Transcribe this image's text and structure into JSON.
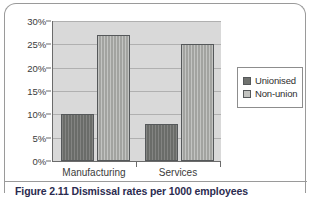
{
  "chart_data": {
    "type": "bar",
    "title": "",
    "xlabel": "",
    "ylabel": "",
    "categories": [
      "Manufacturing",
      "Services"
    ],
    "series": [
      {
        "name": "Unionised",
        "values": [
          10,
          8
        ],
        "color": "#70726f"
      },
      {
        "name": "Non-union",
        "values": [
          27,
          25
        ],
        "color": "#a9aaa7"
      }
    ],
    "ylim": [
      0,
      30
    ],
    "ytick_values": [
      0,
      5,
      10,
      15,
      20,
      25,
      30
    ],
    "ytick_labels": [
      "0%",
      "5%",
      "10%",
      "15%",
      "20%",
      "25%",
      "30%"
    ],
    "grid": true,
    "legend_position": "right",
    "plot_background": "#d9d9d9"
  },
  "legend": {
    "entries": [
      {
        "label": "Unionised"
      },
      {
        "label": "Non-union"
      }
    ]
  },
  "caption": {
    "text": "Figure 2.11  Dismissal rates per 1000 employees"
  }
}
